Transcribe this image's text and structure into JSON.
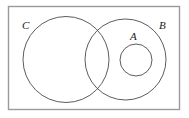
{
  "figure": {
    "background_color": "#ffffff",
    "stroke_color": "#4a4a4a",
    "frame_color": "#9a9a9a",
    "label_color": "#1a1a1a"
  },
  "frame": {
    "name": "universal-set-rectangle",
    "x": 8,
    "y": 6,
    "width": 172,
    "height": 104
  },
  "sets": [
    {
      "id": "C",
      "label": "C",
      "shape": "circle",
      "cx": 66,
      "cy": 59.5,
      "r": 43,
      "label_x": 22,
      "label_y": 29
    },
    {
      "id": "B",
      "label": "B",
      "shape": "circle",
      "cx": 125.5,
      "cy": 59.5,
      "r": 40.5,
      "label_x": 159,
      "label_y": 29
    },
    {
      "id": "A",
      "label": "A",
      "shape": "circle",
      "cx": 136,
      "cy": 60,
      "r": 16,
      "label_x": 130,
      "label_y": 40
    }
  ]
}
